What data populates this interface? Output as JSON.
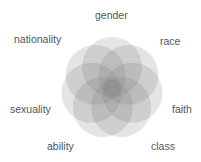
{
  "diagram": {
    "type": "overlapping-circles",
    "center": [
      112,
      88
    ],
    "circle_radius": 30,
    "orbit_radius": 21,
    "fill_color": "#7a7a7a",
    "fill_opacity": 0.2,
    "labels": [
      {
        "text": "gender",
        "x": 95,
        "y": 10
      },
      {
        "text": "race",
        "x": 160,
        "y": 36
      },
      {
        "text": "faith",
        "x": 172,
        "y": 104
      },
      {
        "text": "class",
        "x": 151,
        "y": 141
      },
      {
        "text": "ability",
        "x": 47,
        "y": 141
      },
      {
        "text": "sexuality",
        "x": 10,
        "y": 104
      },
      {
        "text": "nationality",
        "x": 14,
        "y": 34
      }
    ]
  }
}
